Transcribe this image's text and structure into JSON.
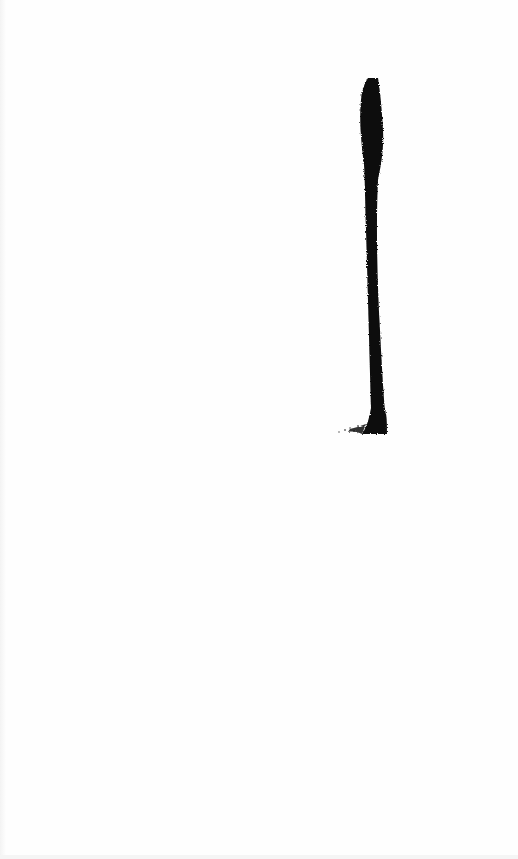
{
  "image": {
    "description": "Single black ink brush stroke, vertical, on white background",
    "background_color": "#fefefe",
    "ink_color": "#0a0a0a",
    "stroke": {
      "type": "vertical-brush-stroke",
      "top": {
        "x": 370,
        "y": 78
      },
      "bottom": {
        "x": 380,
        "y": 434
      },
      "max_width_px": 20
    }
  }
}
